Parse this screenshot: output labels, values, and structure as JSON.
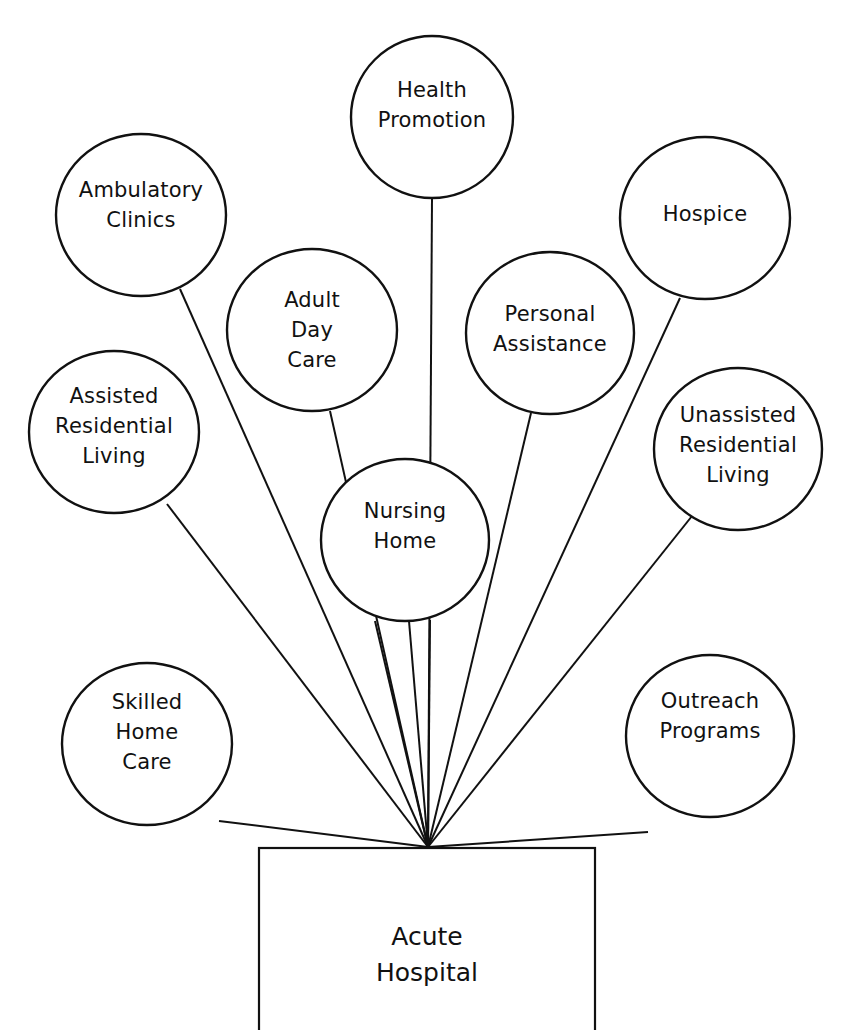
{
  "diagram": {
    "hub": {
      "label": "Acute\nHospital",
      "box": {
        "x": 259,
        "y": 848,
        "w": 336,
        "h": 214
      },
      "apex": {
        "x": 428,
        "y": 847
      }
    },
    "stroke_color": "#111111",
    "background": "#ffffff",
    "nodes": [
      {
        "id": "health-promotion",
        "label": "Health\nPromotion",
        "cx": 432,
        "cy": 117,
        "rx": 81,
        "ry": 81,
        "line_from": [
          432,
          198
        ],
        "label_dy": -12
      },
      {
        "id": "ambulatory-clinics",
        "label": "Ambulatory\nClinics",
        "cx": 141,
        "cy": 215,
        "rx": 85,
        "ry": 81,
        "line_from": [
          180,
          289
        ],
        "label_dy": -10
      },
      {
        "id": "hospice",
        "label": "Hospice",
        "cx": 705,
        "cy": 218,
        "rx": 85,
        "ry": 81,
        "line_from": [
          680,
          298
        ],
        "label_dy": -4
      },
      {
        "id": "adult-day-care",
        "label": "Adult\nDay\nCare",
        "cx": 312,
        "cy": 330,
        "rx": 85,
        "ry": 81,
        "line_from": [
          330,
          411
        ],
        "label_dy": 0
      },
      {
        "id": "personal-assistance",
        "label": "Personal\nAssistance",
        "cx": 550,
        "cy": 333,
        "rx": 84,
        "ry": 81,
        "line_from": [
          531,
          413
        ],
        "label_dy": -4
      },
      {
        "id": "assisted-residential-living",
        "label": "Assisted\nResidential\nLiving",
        "cx": 114,
        "cy": 432,
        "rx": 85,
        "ry": 81,
        "line_from": [
          167,
          504
        ],
        "label_dy": -6
      },
      {
        "id": "nursing-home",
        "label": "Nursing\nHome",
        "cx": 405,
        "cy": 540,
        "rx": 84,
        "ry": 81,
        "line_from": [
          409,
          621
        ],
        "label_dy": -14
      },
      {
        "id": "unassisted-residential-living",
        "label": "Unassisted\nResidential\nLiving",
        "cx": 738,
        "cy": 449,
        "rx": 84,
        "ry": 81,
        "line_from": [
          692,
          516
        ],
        "label_dy": -4
      },
      {
        "id": "skilled-home-care",
        "label": "Skilled\nHome\nCare",
        "cx": 147,
        "cy": 744,
        "rx": 85,
        "ry": 81,
        "line_from": [
          219,
          821
        ],
        "label_dy": -12
      },
      {
        "id": "outreach-programs",
        "label": "Outreach\nPrograms",
        "cx": 710,
        "cy": 736,
        "rx": 84,
        "ry": 81,
        "line_from": [
          648,
          832
        ],
        "label_dy": -20
      }
    ],
    "extra_spokes": [
      {
        "id": "nursing-home-spoke-left",
        "from": [
          375,
          621
        ]
      },
      {
        "id": "nursing-home-spoke-right",
        "from": [
          430,
          620
        ]
      }
    ]
  }
}
